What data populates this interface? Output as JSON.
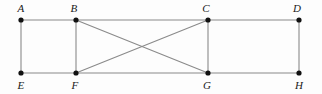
{
  "figure": {
    "type": "geometry-diagram",
    "canvas": {
      "width": 322,
      "height": 94,
      "background_color": "#fdfdfd"
    },
    "style": {
      "edge_color": "#8a8a8a",
      "edge_width": 1.1,
      "vertex_color": "#111111",
      "vertex_radius": 2.6,
      "label_color": "#1a1a1a",
      "label_font_size": 11,
      "label_style": "italic-serif"
    },
    "vertices": [
      {
        "id": "A",
        "label": "A",
        "x": 21,
        "y": 20,
        "label_x": 21,
        "label_y": 8,
        "row": "top"
      },
      {
        "id": "B",
        "label": "B",
        "x": 76,
        "y": 20,
        "label_x": 74,
        "label_y": 8,
        "row": "top"
      },
      {
        "id": "C",
        "label": "C",
        "x": 208,
        "y": 20,
        "label_x": 206,
        "label_y": 8,
        "row": "top"
      },
      {
        "id": "D",
        "label": "D",
        "x": 299,
        "y": 20,
        "label_x": 297,
        "label_y": 8,
        "row": "top"
      },
      {
        "id": "E",
        "label": "E",
        "x": 21,
        "y": 73,
        "label_x": 21,
        "label_y": 85,
        "row": "bottom"
      },
      {
        "id": "F",
        "label": "F",
        "x": 76,
        "y": 73,
        "label_x": 75,
        "label_y": 85,
        "row": "bottom"
      },
      {
        "id": "G",
        "label": "G",
        "x": 208,
        "y": 73,
        "label_x": 207,
        "label_y": 85,
        "row": "bottom"
      },
      {
        "id": "H",
        "label": "H",
        "x": 299,
        "y": 73,
        "label_x": 299,
        "label_y": 85,
        "row": "bottom"
      }
    ],
    "edges": [
      {
        "from": "A",
        "to": "B",
        "kind": "top-side"
      },
      {
        "from": "B",
        "to": "C",
        "kind": "top-side"
      },
      {
        "from": "C",
        "to": "D",
        "kind": "top-side"
      },
      {
        "from": "E",
        "to": "F",
        "kind": "bottom-side"
      },
      {
        "from": "F",
        "to": "G",
        "kind": "bottom-side"
      },
      {
        "from": "G",
        "to": "H",
        "kind": "bottom-side"
      },
      {
        "from": "A",
        "to": "E",
        "kind": "vertical"
      },
      {
        "from": "B",
        "to": "F",
        "kind": "vertical"
      },
      {
        "from": "C",
        "to": "G",
        "kind": "vertical"
      },
      {
        "from": "D",
        "to": "H",
        "kind": "vertical"
      },
      {
        "from": "B",
        "to": "G",
        "kind": "diagonal"
      },
      {
        "from": "C",
        "to": "F",
        "kind": "diagonal"
      }
    ],
    "intersections": [
      {
        "of": [
          "B-G",
          "C-F"
        ],
        "x": 142,
        "y": 47
      }
    ]
  }
}
